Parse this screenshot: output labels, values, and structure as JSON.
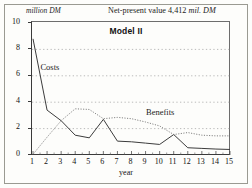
{
  "figure": {
    "unit_label": "million DM",
    "npv_prefix": "Net-present value 4,412 ",
    "npv_unit": "mil. DM",
    "model_title": "Model II"
  },
  "chart_data": {
    "type": "line",
    "title": "Model II",
    "subtitle": "Net-present value 4,412 mil. DM",
    "xlabel": "year",
    "ylabel": "million DM",
    "xlim": [
      1,
      15
    ],
    "ylim": [
      0,
      10
    ],
    "yticks": [
      0,
      2,
      4,
      6,
      8,
      10
    ],
    "yticklabels": [
      "0",
      "2",
      "4",
      "6",
      "8",
      "10"
    ],
    "xticks": [
      1,
      2,
      3,
      4,
      5,
      6,
      7,
      8,
      9,
      10,
      11,
      12,
      13,
      14,
      15
    ],
    "xticklabels": [
      "1",
      "2",
      "3",
      "4",
      "5",
      "6",
      "7",
      "8",
      "9",
      "10",
      "11",
      "12",
      "13",
      "14",
      "15"
    ],
    "grid": "horizontal-dotted",
    "legend": "inline-annotations",
    "x": [
      1,
      2,
      3,
      4,
      5,
      6,
      7,
      8,
      9,
      10,
      11,
      12,
      13,
      14,
      15
    ],
    "series": [
      {
        "name": "Costs",
        "style": "solid",
        "color": "#3c3c3c",
        "values": [
          8.8,
          3.4,
          2.6,
          1.5,
          1.3,
          2.7,
          1.05,
          1.0,
          0.9,
          0.8,
          1.55,
          0.55,
          0.5,
          0.45,
          0.42
        ]
      },
      {
        "name": "Benefits",
        "style": "dotted",
        "color": "#6e6e6e",
        "values": [
          0.05,
          1.35,
          2.6,
          3.5,
          3.45,
          2.75,
          2.85,
          2.75,
          2.5,
          2.2,
          1.55,
          1.7,
          1.5,
          1.45,
          1.45
        ]
      }
    ],
    "annotations": [
      {
        "text": "Costs",
        "x": 1.6,
        "y": 6.6
      },
      {
        "text": "Benefits",
        "x": 9.1,
        "y": 3.2
      }
    ]
  }
}
